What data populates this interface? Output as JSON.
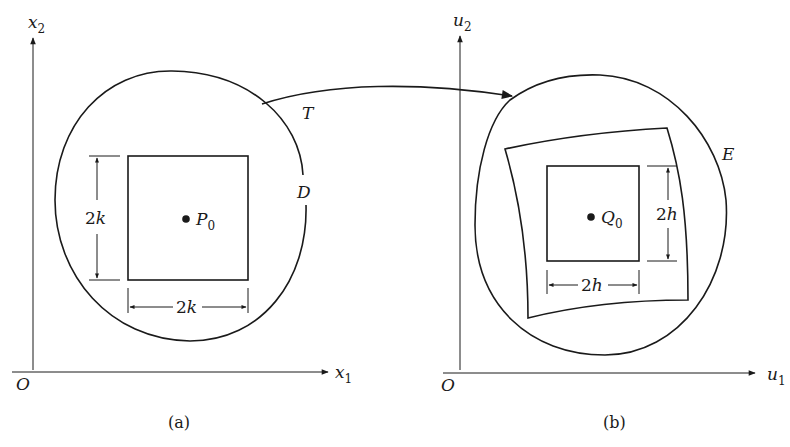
{
  "panel_a": {
    "axis_x": {
      "base": "x",
      "sub": "1"
    },
    "axis_y": {
      "base": "x",
      "sub": "2"
    },
    "origin": "O",
    "region": "D",
    "point": {
      "base": "P",
      "sub": "0"
    },
    "square_height": {
      "num": "2",
      "var": "k"
    },
    "square_width": {
      "num": "2",
      "var": "k"
    },
    "caption": "(a)"
  },
  "panel_b": {
    "axis_x": {
      "base": "u",
      "sub": "1"
    },
    "axis_y": {
      "base": "u",
      "sub": "2"
    },
    "origin": "O",
    "region": "E",
    "point": {
      "base": "Q",
      "sub": "0"
    },
    "square_height": {
      "num": "2",
      "var": "h"
    },
    "square_width": {
      "num": "2",
      "var": "h"
    },
    "caption": "(b)"
  },
  "mapping": {
    "label": "T"
  }
}
